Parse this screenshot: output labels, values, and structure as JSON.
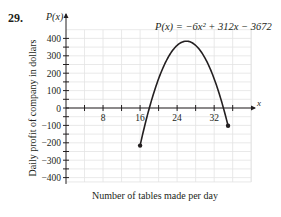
{
  "page": {
    "top_cut_text": "which months of the year?",
    "problem_number": "29."
  },
  "chart_data": {
    "type": "line",
    "title": "",
    "equation": "P(x) = −6x² + 312x − 3672",
    "function": {
      "a": -6,
      "b": 312,
      "c": -3672
    },
    "domain": [
      16,
      35
    ],
    "endpoints": [
      {
        "x": 16,
        "y": -216
      },
      {
        "x": 35,
        "y": -102
      }
    ],
    "vertex": {
      "x": 26,
      "y": 384
    },
    "xlabel": "Number of tables made per day",
    "ylabel": "Daily profit of company in dollars",
    "x_axis_name": "x",
    "y_axis_name": "P(x)",
    "xlim": [
      0,
      40
    ],
    "ylim": [
      -400,
      400
    ],
    "x_ticks": [
      8,
      16,
      24,
      32
    ],
    "y_ticks": [
      400,
      300,
      200,
      100,
      0,
      -100,
      -200,
      -300,
      -400
    ],
    "x_minor_step": 4,
    "y_minor_step": 50,
    "grid": true,
    "legend": null,
    "colors": {
      "curve": "#231f20",
      "grid": "#e3e3e3",
      "axis": "#231f20"
    }
  }
}
